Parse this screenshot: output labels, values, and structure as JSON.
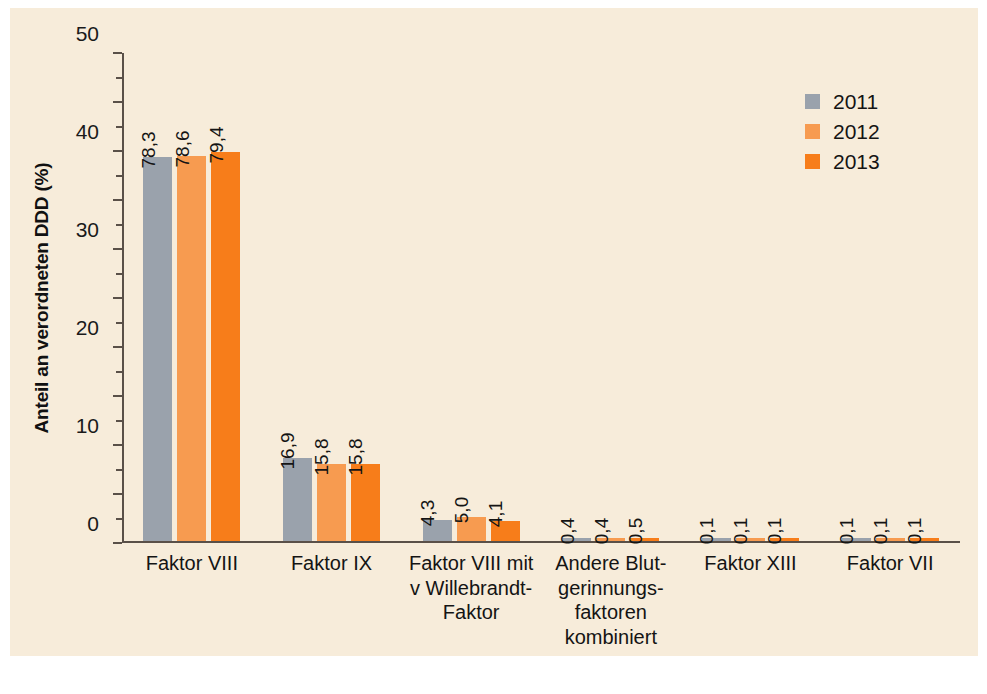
{
  "chart_data": {
    "type": "bar",
    "title": "",
    "xlabel": "",
    "ylabel": "Anteil an verordneten DDD (%)",
    "ylim": [
      0,
      100
    ],
    "ytick_step": 10,
    "yminor_step": 5,
    "grid": false,
    "legend_position": "top-right",
    "yticks": [
      "0",
      "10",
      "20",
      "30",
      "40",
      "50",
      "60",
      "70",
      "80",
      "90",
      "100"
    ],
    "categories": [
      "Faktor VIII",
      "Faktor IX",
      "Faktor VIII mit v Willebrandt-Faktor",
      "Andere Blutgerinnungsfaktoren kombiniert",
      "Faktor XIII",
      "Faktor VII"
    ],
    "category_lines": [
      [
        "Faktor VIII"
      ],
      [
        "Faktor IX"
      ],
      [
        "Faktor VIII mit",
        "v Willebrandt-",
        "Faktor"
      ],
      [
        "Andere Blut-",
        "gerinnungs-",
        "faktoren",
        "kombiniert"
      ],
      [
        "Faktor XIII"
      ],
      [
        "Faktor VII"
      ]
    ],
    "series": [
      {
        "name": "2011",
        "color": "#9aa2ac",
        "values": [
          78.3,
          16.9,
          4.3,
          0.4,
          0.1,
          0.1
        ],
        "labels": [
          "78,3",
          "16,9",
          "4,3",
          "0,4",
          "0,1",
          "0,1"
        ]
      },
      {
        "name": "2012",
        "color": "#f79b50",
        "values": [
          78.6,
          15.8,
          5.0,
          0.4,
          0.1,
          0.1
        ],
        "labels": [
          "78,6",
          "15,8",
          "5,0",
          "0,4",
          "0,1",
          "0,1"
        ]
      },
      {
        "name": "2013",
        "color": "#f77d1a",
        "values": [
          79.4,
          15.8,
          4.1,
          0.5,
          0.1,
          0.1
        ],
        "labels": [
          "79,4",
          "15,8",
          "4,1",
          "0,5",
          "0,1",
          "0,1"
        ]
      }
    ]
  },
  "colors": {
    "figure_background": "#f7ecda",
    "page_background": "#ffffff",
    "axis": "#5a5048",
    "text": "#141414",
    "series_2011": "#9aa2ac",
    "series_2012": "#f79b50",
    "series_2013": "#f77d1a"
  }
}
